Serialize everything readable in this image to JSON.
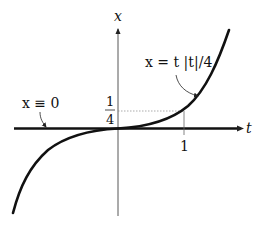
{
  "diagram": {
    "axes": {
      "vertical_label": "x",
      "horizontal_label": "t"
    },
    "ticks": {
      "t_tick": "1",
      "x_tick_numerator": "1",
      "x_tick_denominator": "4"
    },
    "curves": [
      {
        "name": "cubic-like solution",
        "label": "x = t |t|/4"
      },
      {
        "name": "zero solution",
        "label": "x ≡ 0"
      }
    ],
    "labels": {
      "solution_label": "x = t |t|/4",
      "zero_label": "x ≡ 0"
    },
    "colors": {
      "curve": "#111111",
      "axis": "#222222",
      "guide": "#888888"
    }
  }
}
